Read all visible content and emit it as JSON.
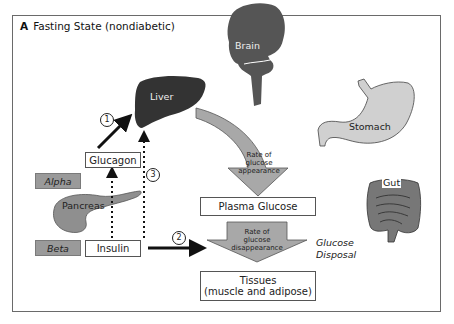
{
  "figure": {
    "panel_letter": "A",
    "title": "Fasting State (nondiabetic)"
  },
  "organs": {
    "brain": "Brain",
    "liver": "Liver",
    "stomach": "Stomach",
    "gut": "Gut",
    "pancreas": "Pancreas"
  },
  "pancreas_cells": {
    "alpha": "Alpha",
    "beta": "Beta"
  },
  "hormones": {
    "glucagon": "Glucagon",
    "insulin": "Insulin"
  },
  "boxes": {
    "plasma_glucose": "Plasma Glucose",
    "tissues_line1": "Tissues",
    "tissues_line2": "(muscle and adipose)"
  },
  "arrows": {
    "appearance": [
      "Rate of",
      "glucose",
      "appearance"
    ],
    "disappearance": [
      "Rate of",
      "glucose",
      "disappearance"
    ]
  },
  "side_label": [
    "Glucose",
    "Disposal"
  ],
  "step_numbers": [
    "1",
    "2",
    "3"
  ],
  "colors": {
    "dark_organ": "#3c3c3c",
    "organ_gray": "#8f8f8f",
    "light_organ": "#c9c9c9",
    "arrow_fill": "#a8a8a8",
    "cell_fill": "#9a9a9a",
    "frame": "#6a6a6a"
  }
}
